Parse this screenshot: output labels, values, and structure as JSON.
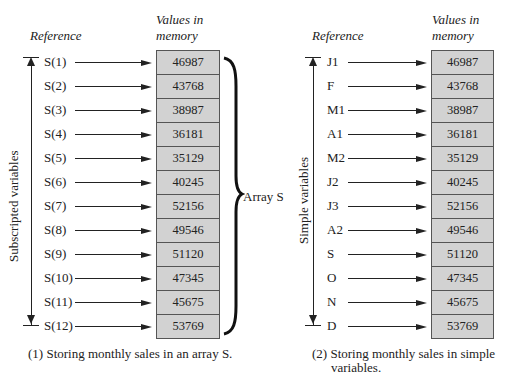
{
  "left_panel": {
    "header_reference": "Reference",
    "header_values_line1": "Values in",
    "header_values_line2": "memory",
    "axis_label": "Subscripted  variables",
    "brace_label": "Array S",
    "caption": "(1)  Storing monthly sales in an array S.",
    "rows": [
      {
        "ref": "S(1)",
        "value": "46987"
      },
      {
        "ref": "S(2)",
        "value": "43768"
      },
      {
        "ref": "S(3)",
        "value": "38987"
      },
      {
        "ref": "S(4)",
        "value": "36181"
      },
      {
        "ref": "S(5)",
        "value": "35129"
      },
      {
        "ref": "S(6)",
        "value": "40245"
      },
      {
        "ref": "S(7)",
        "value": "52156"
      },
      {
        "ref": "S(8)",
        "value": "49546"
      },
      {
        "ref": "S(9)",
        "value": "51120"
      },
      {
        "ref": "S(10)",
        "value": "47345"
      },
      {
        "ref": "S(11)",
        "value": "45675"
      },
      {
        "ref": "S(12)",
        "value": "53769"
      }
    ]
  },
  "right_panel": {
    "header_reference": "Reference",
    "header_values_line1": "Values in",
    "header_values_line2": "memory",
    "axis_label": "Simple  variables",
    "caption_line1": "(2)  Storing monthly sales in simple",
    "caption_line2": "variables.",
    "rows": [
      {
        "ref": "J1",
        "value": "46987"
      },
      {
        "ref": "F",
        "value": "43768"
      },
      {
        "ref": "M1",
        "value": "38987"
      },
      {
        "ref": "A1",
        "value": "36181"
      },
      {
        "ref": "M2",
        "value": "35129"
      },
      {
        "ref": "J2",
        "value": "40245"
      },
      {
        "ref": "J3",
        "value": "52156"
      },
      {
        "ref": "A2",
        "value": "49546"
      },
      {
        "ref": "S",
        "value": "51120"
      },
      {
        "ref": "O",
        "value": "47345"
      },
      {
        "ref": "N",
        "value": "45675"
      },
      {
        "ref": "D",
        "value": "53769"
      }
    ]
  },
  "colors": {
    "cell_fill": "#d2d2d2",
    "cell_border": "#555555",
    "ink": "#222222"
  }
}
